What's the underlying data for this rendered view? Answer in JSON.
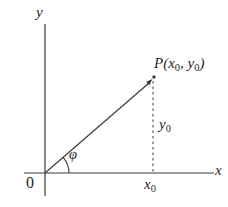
{
  "figure": {
    "background": "#ffffff",
    "line_color": "#3c3c3c",
    "text_color": "#1f1f1f",
    "labels": {
      "y_axis": "y",
      "x_axis": "x",
      "origin": "0",
      "angle": "φ",
      "point": {
        "prefix": "P(x",
        "sub1": "0",
        "mid": ", y",
        "sub2": "0",
        "suffix": ")"
      },
      "x0": {
        "base": "x",
        "sub": "0"
      },
      "y0": {
        "base": "y",
        "sub": "0"
      }
    }
  }
}
